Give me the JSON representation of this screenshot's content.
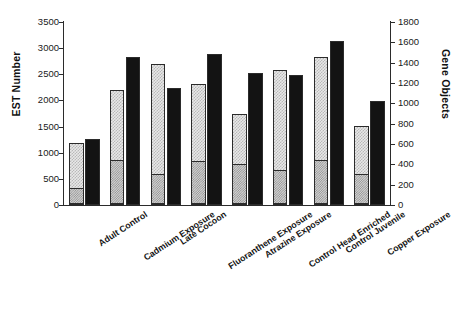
{
  "chart_data": {
    "type": "bar",
    "title": "",
    "subtitle": "",
    "xlabel": "",
    "ylabel": "EST Number",
    "ylabel_secondary": "Gene Objects",
    "grid": false,
    "legend": "none",
    "ylim": [
      0,
      3500
    ],
    "ylim_secondary": [
      0,
      1800
    ],
    "yticks": [
      0,
      500,
      1000,
      1500,
      2000,
      2500,
      3000,
      3500
    ],
    "yticks_secondary": [
      0,
      200,
      400,
      600,
      800,
      1000,
      1200,
      1400,
      1600,
      1800
    ],
    "categories": [
      "Adult Control",
      "Cadmium Exposure",
      "Late Cocoon",
      "Fluoranthene Exposure",
      "Atrazine Exposure",
      "Control Head Enriched",
      "Control Juvenile",
      "Copper Exposure"
    ],
    "series": [
      {
        "name": "EST Number",
        "axis": "left",
        "values": [
          1180,
          2200,
          2700,
          2320,
          1750,
          2580,
          2830,
          1520
        ]
      },
      {
        "name": "EST Number (lower segment)",
        "axis": "left",
        "values": [
          310,
          850,
          570,
          830,
          760,
          660,
          850,
          570
        ]
      },
      {
        "name": "Gene Objects",
        "axis": "right",
        "values": [
          645,
          1455,
          1155,
          1490,
          1300,
          1280,
          1610,
          1028
        ]
      }
    ]
  },
  "axes": {
    "left_title": "EST Number",
    "right_title": "Gene Objects",
    "left_ticks": [
      "0",
      "500",
      "1000",
      "1500",
      "2000",
      "2500",
      "3000",
      "3500"
    ],
    "right_ticks": [
      "0",
      "200",
      "400",
      "600",
      "800",
      "1000",
      "1200",
      "1400",
      "1600",
      "1800"
    ]
  },
  "colors": {
    "bar_est_fill": "#e8e8e8",
    "bar_est_pattern": "#b9b9b9",
    "bar_est_lower_fill": "#d2d2d2",
    "bar_est_lower_pattern": "#8f8f8f",
    "bar_gene_fill": "#131313",
    "axis": "#2b2b2b",
    "text": "#1a1a1a",
    "background": "#ffffff"
  }
}
